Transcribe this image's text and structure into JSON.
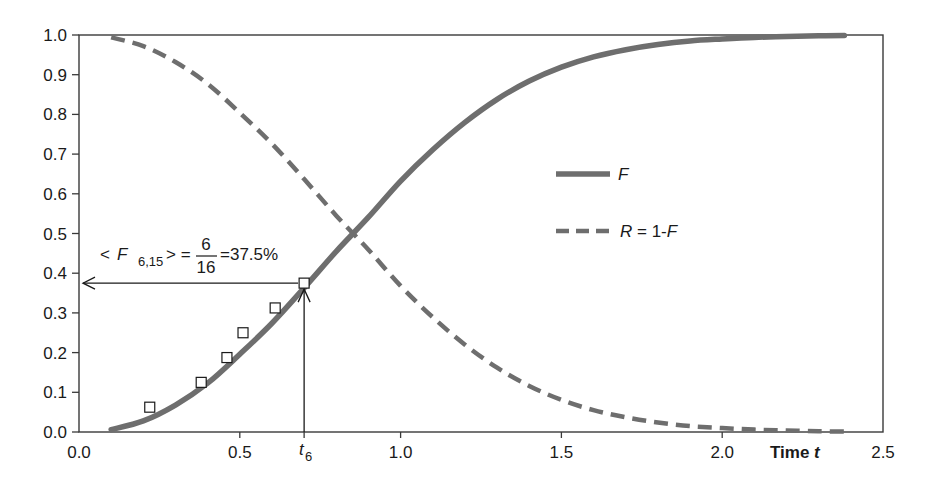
{
  "chart_data": {
    "type": "line",
    "title": "",
    "xlabel": "Time t",
    "ylabel": "",
    "xlim": [
      0.0,
      2.5
    ],
    "ylim": [
      0.0,
      1.0
    ],
    "grid": false,
    "legend_position": "inside-right-middle",
    "x_ticks": [
      "0.0",
      "0.5",
      "1.0",
      "1.5",
      "2.0",
      "2.5"
    ],
    "x_tick_values": [
      0.0,
      0.5,
      1.0,
      1.5,
      2.0,
      2.5
    ],
    "y_ticks": [
      "0.0",
      "0.1",
      "0.2",
      "0.3",
      "0.4",
      "0.5",
      "0.6",
      "0.7",
      "0.8",
      "0.9",
      "1.0"
    ],
    "y_tick_values": [
      0.0,
      0.1,
      0.2,
      0.3,
      0.4,
      0.5,
      0.6,
      0.7,
      0.8,
      0.9,
      1.0
    ],
    "series": [
      {
        "name": "F",
        "style": "solid",
        "color": "#6e6e6e",
        "x": [
          0.1,
          0.2,
          0.3,
          0.4,
          0.5,
          0.6,
          0.7,
          0.8,
          0.9,
          1.0,
          1.1,
          1.2,
          1.3,
          1.4,
          1.5,
          1.6,
          1.7,
          1.8,
          1.9,
          2.0,
          2.1,
          2.2,
          2.3,
          2.38
        ],
        "y": [
          0.006,
          0.028,
          0.068,
          0.123,
          0.196,
          0.274,
          0.363,
          0.455,
          0.541,
          0.632,
          0.711,
          0.78,
          0.838,
          0.884,
          0.919,
          0.945,
          0.963,
          0.976,
          0.985,
          0.99,
          0.994,
          0.996,
          0.998,
          0.999
        ]
      },
      {
        "name": "R = 1-F",
        "style": "dashed",
        "color": "#6e6e6e",
        "x": [
          0.1,
          0.2,
          0.3,
          0.4,
          0.5,
          0.6,
          0.7,
          0.8,
          0.9,
          1.0,
          1.1,
          1.2,
          1.3,
          1.4,
          1.5,
          1.6,
          1.7,
          1.8,
          1.9,
          2.0,
          2.1,
          2.2,
          2.3,
          2.38
        ],
        "y": [
          0.994,
          0.972,
          0.932,
          0.877,
          0.804,
          0.726,
          0.637,
          0.545,
          0.459,
          0.368,
          0.289,
          0.22,
          0.162,
          0.116,
          0.081,
          0.055,
          0.037,
          0.024,
          0.015,
          0.01,
          0.006,
          0.004,
          0.002,
          0.001
        ]
      },
      {
        "name": "empirical points",
        "style": "markers-square-open",
        "color": "#1a1a1a",
        "x": [
          0.22,
          0.38,
          0.46,
          0.51,
          0.61,
          0.7
        ],
        "y": [
          0.0625,
          0.125,
          0.1875,
          0.25,
          0.3125,
          0.375
        ]
      }
    ],
    "legend": [
      {
        "label": "F",
        "style": "solid"
      },
      {
        "label": "R = 1-F",
        "style": "dashed"
      }
    ],
    "annotations": [
      {
        "text": "<F6,15> = 6/16 = 37.5%",
        "lhs": "<F",
        "lhs_sub": "6,15",
        "lhs_close": "> =",
        "numerator": "6",
        "denominator": "16",
        "rhs": "=37.5%",
        "arrow_to_y_axis_at": 0.375
      },
      {
        "text": "t6",
        "symbol": "t",
        "sub": "6",
        "x": 0.7,
        "arrow_from_x_axis_to_point": [
          0.7,
          0.375
        ]
      }
    ]
  },
  "labels": {
    "xlabel_prefix": "Time ",
    "xlabel_var": "t",
    "legend_f": "F",
    "legend_r_var": "R",
    "legend_r_rest": " = 1-",
    "legend_r_var2": "F"
  }
}
